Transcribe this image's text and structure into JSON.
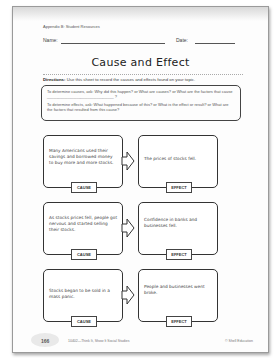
{
  "header": {
    "appendix": "Appendix B: Student Resources",
    "name_label": "Name:",
    "date_label": "Date:"
  },
  "title": "Cause and Effect",
  "directions": {
    "label": "Directions:",
    "text": " Use this sheet to record the causes and effects found on your topic."
  },
  "questions": {
    "causes": "To determine causes, ask: Why did this happen? or What are causes? or What are the factors that cause ______________________________ ?",
    "effects": "To determine effects, ask: What happened because of this? or What is the effect or result? or What are the factors that resulted from this cause?"
  },
  "rows": [
    {
      "cause": "Many Americans used their savings and borrowed money to buy more and more stocks.",
      "effect": "The prices of stocks fell."
    },
    {
      "cause": "As stocks prices fell, people got nervous and started selling their stocks.",
      "effect": "Confidence in banks and businesses fell."
    },
    {
      "cause": "Stocks began to be sold in a mass panic.",
      "effect": "People and businesses went broke."
    }
  ],
  "labels": {
    "cause": "CAUSE",
    "effect": "EFFECT"
  },
  "footer": {
    "page": "166",
    "title": "10402—Think It, Show It Social Studies",
    "copyright": "© Shell Education"
  }
}
